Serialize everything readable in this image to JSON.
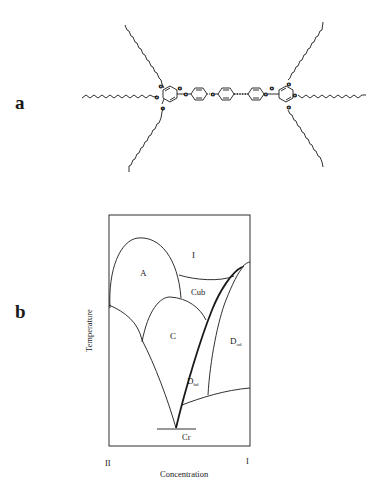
{
  "figure": {
    "panel_a": {
      "label": "a",
      "description": "Swallow-tailed (polycatenar) mesogen: two 3,4,5-tris(alkoxy)benzoate head groups with long alkyl chains linked through a central aromatic core"
    },
    "panel_b": {
      "label": "b",
      "title": "Phase diagram",
      "xlabel": "Concentration",
      "ylabel": "Temperature",
      "x_left_label": "II",
      "x_right_label": "I",
      "regions": {
        "isotropic": "I",
        "smectic_a": "A",
        "cubic": "Cub",
        "smectic_c": "C",
        "columnar_disordered_main": "D",
        "columnar_disordered_sub": "od",
        "columnar_hex_main": "D",
        "columnar_hex_sub": "hd",
        "crystal": "Cr"
      }
    }
  },
  "colors": {
    "ink": "#1a1a1a",
    "background": "#ffffff"
  }
}
